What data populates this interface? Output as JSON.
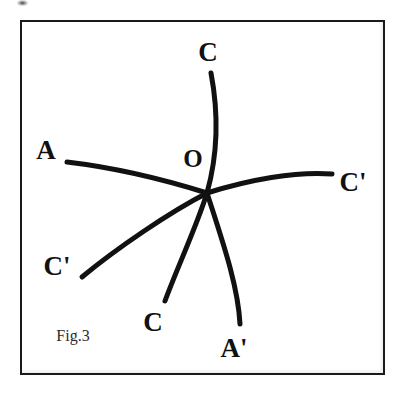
{
  "figure": {
    "caption": "Fig.3",
    "caption_position": {
      "x": 73,
      "y": 336
    },
    "frame": {
      "x": 20,
      "y": 20,
      "width": 365,
      "height": 355,
      "border_color": "#1a1a1a",
      "border_width": 2
    },
    "background_color": "#ffffff",
    "ink_color": "#111111",
    "center_label": "O",
    "center_point": {
      "x": 207,
      "y": 193
    }
  },
  "labels": [
    {
      "id": "label-c-top",
      "text": "C",
      "x": 208,
      "y": 52
    },
    {
      "id": "label-a-left",
      "text": "A",
      "x": 46,
      "y": 150
    },
    {
      "id": "label-o-center",
      "text": "O",
      "x": 193,
      "y": 158
    },
    {
      "id": "label-cprime-right",
      "text": "C'",
      "x": 353,
      "y": 182
    },
    {
      "id": "label-cprime-left",
      "text": "C'",
      "x": 57,
      "y": 266
    },
    {
      "id": "label-c-bottom",
      "text": "C",
      "x": 153,
      "y": 322
    },
    {
      "id": "label-aprime-bottom",
      "text": "A'",
      "x": 234,
      "y": 348
    }
  ],
  "curves": [
    {
      "id": "curve-c-aprime",
      "name": "curve-c-to-a-prime",
      "from_label": "C",
      "to_label": "A'",
      "path": "M 211 73 C 218 110, 219 150, 207 193 C 222 240, 238 285, 240 324",
      "stroke_width": 5
    },
    {
      "id": "curve-a-cprime-right",
      "name": "curve-a-to-c-prime-right",
      "from_label": "A",
      "to_label": "C'",
      "path": "M 67 162 C 118 168, 172 182, 207 193 C 248 180, 296 171, 332 174",
      "stroke_width": 5
    },
    {
      "id": "curve-cprime-left-c-bottom",
      "name": "curve-c-prime-left-to-c-bottom",
      "from_label": "C'",
      "to_label": "C",
      "path": "M 82 277 C 117 248, 170 212, 207 193 C 196 228, 177 268, 165 301",
      "stroke_width": 5
    }
  ]
}
